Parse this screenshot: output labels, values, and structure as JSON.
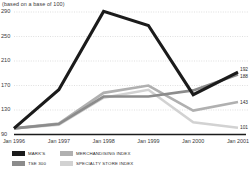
{
  "chart_data": {
    "type": "line",
    "title": "",
    "subtitle": "(based on a base of 100)",
    "xlabel": "",
    "ylabel": "",
    "categories": [
      "Jan 1996",
      "Jan 1997",
      "Jan 1998",
      "Jan 1999",
      "Jan 2000",
      "Jan 2001"
    ],
    "ylim": [
      90,
      290
    ],
    "yticks": [
      90,
      130,
      170,
      210,
      250,
      290
    ],
    "ytick_labels": [
      "90",
      "130",
      "170",
      "210",
      "250",
      "290"
    ],
    "grid": true,
    "legend_position": "bottom-left",
    "series": [
      {
        "name": "MARK'S",
        "color": "#1b1b1b",
        "values": [
          100,
          163,
          291,
          268,
          155,
          192
        ],
        "end_label": "192"
      },
      {
        "name": "TSE 300",
        "color": "#8c8c8c",
        "values": [
          100,
          107,
          152,
          152,
          162,
          188
        ],
        "end_label": "188"
      },
      {
        "name": "MERCHANDISING INDEX",
        "color": "#b0b0b0",
        "values": [
          100,
          108,
          158,
          170,
          129,
          143
        ],
        "end_label": "143"
      },
      {
        "name": "SPECIALTY STORE INDEX",
        "color": "#d2d2d2",
        "values": [
          100,
          106,
          150,
          163,
          110,
          101
        ],
        "end_label": "101"
      }
    ]
  },
  "legend": {
    "items": [
      {
        "label": "MARK'S",
        "color": "#1b1b1b"
      },
      {
        "label": "TSE 300",
        "color": "#8c8c8c"
      },
      {
        "label": "MERCHANDISING INDEX",
        "color": "#b0b0b0"
      },
      {
        "label": "SPECIALTY STORE INDEX",
        "color": "#d2d2d2"
      }
    ]
  },
  "axis": {
    "baseline_color": "#1b1b1b",
    "grid_color": "#c9c9c9"
  }
}
